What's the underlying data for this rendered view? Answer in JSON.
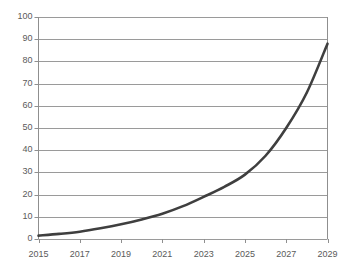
{
  "chart_data": {
    "type": "line",
    "title": "",
    "subtitle": "",
    "xlabel": "",
    "ylabel": "",
    "x": [
      2015,
      2016,
      2017,
      2018,
      2019,
      2020,
      2021,
      2022,
      2023,
      2024,
      2025,
      2026,
      2027,
      2028,
      2029
    ],
    "values": [
      1.5,
      2.3,
      3.3,
      4.8,
      6.6,
      8.8,
      11.4,
      14.8,
      19.0,
      23.5,
      29.0,
      37.5,
      50.0,
      66.0,
      88.0
    ],
    "series": [
      {
        "name": "",
        "values": [
          1.5,
          2.3,
          3.3,
          4.8,
          6.6,
          8.8,
          11.4,
          14.8,
          19.0,
          23.5,
          29.0,
          37.5,
          50.0,
          66.0,
          88.0
        ]
      }
    ],
    "xlim": [
      2015,
      2029
    ],
    "ylim": [
      0,
      100
    ],
    "y_ticks": [
      0,
      10,
      20,
      30,
      40,
      50,
      60,
      70,
      80,
      90,
      100
    ],
    "y_tick_labels": [
      "0",
      "10",
      "20",
      "30",
      "40",
      "50",
      "60",
      "70",
      "80",
      "90",
      "100"
    ],
    "x_ticks": [
      2015,
      2017,
      2019,
      2021,
      2023,
      2025,
      2027,
      2029
    ],
    "x_tick_labels": [
      "2015",
      "2017",
      "2019",
      "2021",
      "2023",
      "2025",
      "2027",
      "2029"
    ],
    "grid": {
      "horizontal": true,
      "vertical": false
    },
    "legend": {
      "visible": false,
      "position": "none",
      "entries": []
    },
    "annotations": [],
    "colors": {
      "line": "#3f3f3f",
      "grid": "#9a9a9a",
      "axis": "#8f8f8f",
      "tick_text": "#5a5a5a",
      "background": "#ffffff"
    },
    "style": {
      "line_width": 2.6,
      "marker": "none",
      "smoothing": "monotone"
    }
  }
}
